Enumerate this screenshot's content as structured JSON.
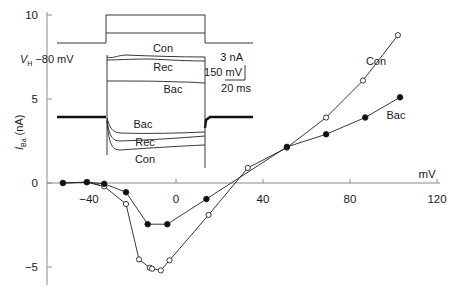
{
  "chart_data": {
    "type": "line",
    "title": "",
    "xlabel": "mV",
    "ylabel_main": "I",
    "ylabel_sub": "Ba",
    "ylabel_unit": "(nA)",
    "xlim": [
      -60,
      120
    ],
    "ylim": [
      -6,
      10
    ],
    "x_ticks": [
      -40,
      0,
      40,
      80,
      120
    ],
    "x_tick_labels": [
      "-40",
      "0",
      "40",
      "80",
      "120"
    ],
    "y_ticks": [
      -5,
      0,
      5,
      10
    ],
    "y_tick_labels": [
      "-5",
      "0",
      "5",
      "10"
    ],
    "grid": false,
    "series": [
      {
        "name": "Con",
        "marker": "open-circle",
        "label": "Con",
        "x": [
          -52,
          -41,
          -33,
          -23,
          -17,
          -12,
          -11,
          -7,
          -3,
          15,
          33,
          51,
          69,
          86,
          102
        ],
        "y": [
          0.0,
          0.05,
          -0.2,
          -1.25,
          -4.55,
          -5.05,
          -5.1,
          -5.2,
          -4.6,
          -1.9,
          0.9,
          2.1,
          3.9,
          6.1,
          8.8
        ]
      },
      {
        "name": "Bac",
        "marker": "filled-circle",
        "label": "Bac",
        "x": [
          -52,
          -41,
          -33,
          -23,
          -13,
          -4,
          14,
          51,
          69,
          87,
          103
        ],
        "y": [
          0.0,
          0.05,
          -0.05,
          -0.55,
          -2.45,
          -2.45,
          -0.95,
          2.15,
          2.9,
          3.9,
          5.1
        ]
      }
    ],
    "inset": {
      "holding_potential_label": "V",
      "holding_potential_sub": "H",
      "holding_potential_value": "−80 mV",
      "scale_bar_current": "3 nA",
      "scale_bar_voltage": "150 mV",
      "scale_bar_time": "20 ms",
      "outward_trace_labels": [
        "Con",
        "Rec",
        "Bac"
      ],
      "inward_trace_labels": [
        "Bac",
        "Rec",
        "Con"
      ]
    }
  }
}
